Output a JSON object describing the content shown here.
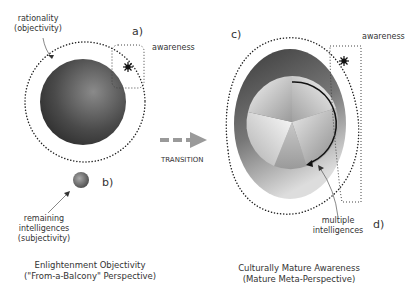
{
  "left": {
    "rationality_label": [
      "rationality",
      "(objectivity)"
    ],
    "awareness_label": "awareness",
    "tag_a": "a)",
    "tag_b": "b)",
    "remaining_label": [
      "remaining",
      "intelligences",
      "(subjectivity)"
    ],
    "caption": [
      "Enlightenment Objectivity",
      "(\"From-a-Balcony\" Perspective)"
    ]
  },
  "transition": {
    "label": "TRANSITION"
  },
  "right": {
    "tag_c": "c)",
    "tag_d": "d)",
    "awareness_label": "awareness",
    "multiple_label": [
      "multiple",
      "intelligences"
    ],
    "caption": [
      "Culturally Mature Awareness",
      "(Mature Meta-Perspective)"
    ]
  },
  "colors": {
    "dark_sphere": "#3a3a3a",
    "dots": "#222222",
    "arrow": "#9a9a9a"
  }
}
